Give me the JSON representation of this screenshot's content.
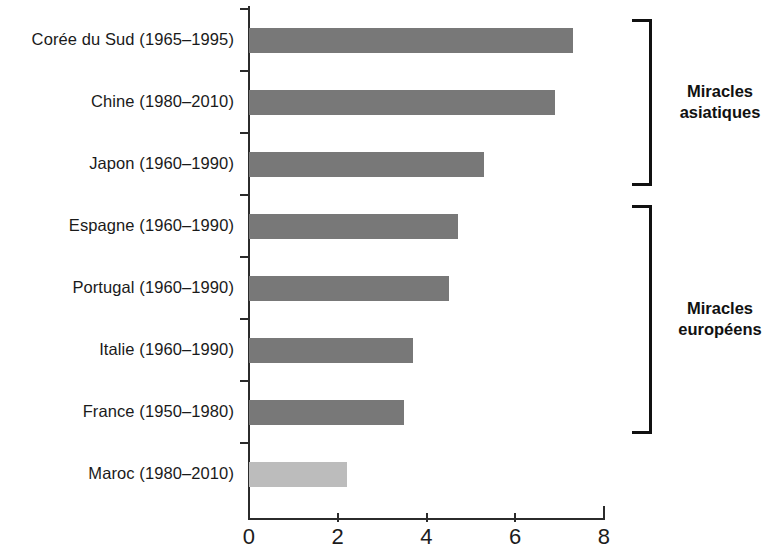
{
  "chart_data": {
    "type": "bar",
    "orientation": "horizontal",
    "title": "",
    "subtitle": "",
    "xlabel": "",
    "ylabel": "",
    "xlim": [
      0,
      8
    ],
    "xticks": [
      0,
      2,
      4,
      6,
      8
    ],
    "xtick_labels": [
      "0",
      "2",
      "4",
      "6",
      "8"
    ],
    "grid": false,
    "legend": null,
    "categories": [
      "Corée du Sud (1965–1995)",
      "Chine (1980–2010)",
      "Japon (1960–1990)",
      "Espagne (1960–1990)",
      "Portugal (1960–1990)",
      "Italie (1960–1990)",
      "France (1950–1980)",
      "Maroc (1980–2010)"
    ],
    "values": [
      7.3,
      6.9,
      5.3,
      4.7,
      4.5,
      3.7,
      3.5,
      2.2
    ],
    "bar_colors": [
      "#787878",
      "#787878",
      "#787878",
      "#787878",
      "#787878",
      "#787878",
      "#787878",
      "#bcbcbc"
    ],
    "colors": {
      "bar_dark": "#787878",
      "bar_light": "#bcbcbc",
      "axis": "#2b2b2b",
      "text": "#1a1a1a",
      "bracket": "#111111",
      "background": "#ffffff"
    },
    "annotations": [
      {
        "label": "Miracles asiatiques",
        "label_line1": "Miracles",
        "label_line2": "asiatiques",
        "covers": [
          "Corée du Sud (1965–1995)",
          "Chine (1980–2010)",
          "Japon (1960–1990)"
        ]
      },
      {
        "label": "Miracles européens",
        "label_line1": "Miracles",
        "label_line2": "européens",
        "covers": [
          "Espagne (1960–1990)",
          "Portugal (1960–1990)",
          "Italie (1960–1990)",
          "France (1950–1980)"
        ]
      }
    ]
  }
}
